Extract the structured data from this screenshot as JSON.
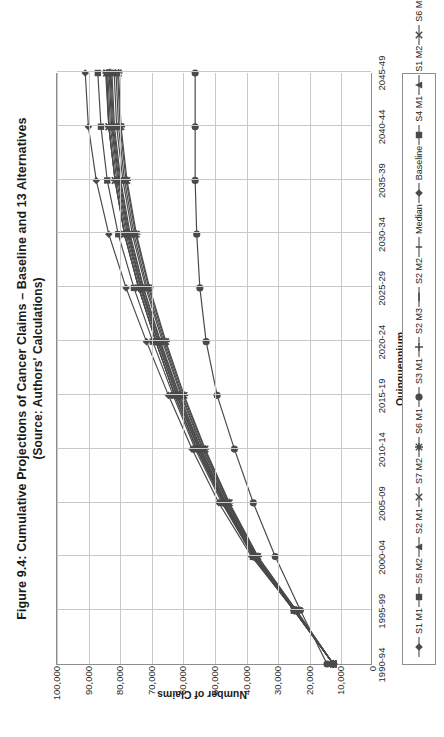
{
  "title": {
    "line1": "Figure 9.4:  Cumulative Projections of Cancer Claims – Baseline and 13 Alternatives",
    "line2": "(Source:  Authors' Calculations)"
  },
  "chart_data": {
    "type": "line",
    "title": "Figure 9.4:  Cumulative Projections of Cancer Claims – Baseline and 13 Alternatives (Source:  Authors' Calculations)",
    "xlabel": "Quinquennium",
    "ylabel": "Number of Claims",
    "grid": true,
    "legend_position": "bottom",
    "ylim": [
      0,
      100000
    ],
    "yticks": [
      0,
      10000,
      20000,
      30000,
      40000,
      50000,
      60000,
      70000,
      80000,
      90000,
      100000
    ],
    "ytick_labels": [
      "0",
      "10,000",
      "20,000",
      "30,000",
      "40,000",
      "50,000",
      "60,000",
      "70,000",
      "80,000",
      "90,000",
      "100,000"
    ],
    "categories": [
      "1990-94",
      "1995-99",
      "2000-04",
      "2005-09",
      "2010-14",
      "2015-19",
      "2020-24",
      "2025-29",
      "2030-34",
      "2035-39",
      "2040-44",
      "2045-49"
    ],
    "series": [
      {
        "name": "S1 M1",
        "marker": "diamond",
        "color": "#4a4a4a",
        "values": [
          12000,
          24500,
          38000,
          48500,
          57000,
          64500,
          71500,
          78000,
          83500,
          87500,
          90000,
          91000
        ]
      },
      {
        "name": "S5 M2",
        "marker": "square",
        "color": "#4a4a4a",
        "values": [
          12000,
          24500,
          37500,
          47500,
          56000,
          63000,
          69500,
          75500,
          80500,
          84000,
          86000,
          87000
        ]
      },
      {
        "name": "S2 M1",
        "marker": "triangle",
        "color": "#4a4a4a",
        "values": [
          12000,
          24500,
          37500,
          47000,
          55500,
          62500,
          68500,
          74000,
          78500,
          81500,
          83500,
          84500
        ]
      },
      {
        "name": "S7 M2",
        "marker": "cross-x",
        "color": "#4a4a4a",
        "values": [
          12000,
          24500,
          37500,
          47000,
          55500,
          62500,
          68500,
          74000,
          78500,
          81500,
          83500,
          84300
        ]
      },
      {
        "name": "S6 M1",
        "marker": "asterisk",
        "color": "#4a4a4a",
        "values": [
          12000,
          24500,
          37500,
          47000,
          55500,
          62500,
          68500,
          74000,
          78500,
          81500,
          83500,
          84100
        ]
      },
      {
        "name": "S3 M1",
        "marker": "circle",
        "color": "#4a4a4a",
        "values": [
          12000,
          24500,
          37500,
          47000,
          55000,
          62000,
          68000,
          73500,
          78000,
          81000,
          83000,
          83800
        ]
      },
      {
        "name": "S2 M3",
        "marker": "plus",
        "color": "#4a4a4a",
        "values": [
          12000,
          24300,
          37200,
          46700,
          54800,
          61800,
          67800,
          73200,
          77600,
          80600,
          82600,
          83400
        ]
      },
      {
        "name": "S2 M2",
        "marker": "dash",
        "color": "#4a4a4a",
        "values": [
          12000,
          24300,
          37000,
          46500,
          54500,
          61500,
          67500,
          73000,
          77300,
          80300,
          82300,
          83100
        ]
      },
      {
        "name": "Median",
        "marker": "line",
        "color": "#4a4a4a",
        "values": [
          12000,
          24200,
          36900,
          46300,
          54300,
          61200,
          67200,
          72600,
          77000,
          80000,
          82000,
          82800
        ]
      },
      {
        "name": "Baseline",
        "marker": "diamond",
        "color": "#4a4a4a",
        "values": [
          12000,
          24200,
          36800,
          46200,
          54100,
          61000,
          67000,
          72400,
          76700,
          79700,
          81700,
          82500
        ]
      },
      {
        "name": "S4 M1",
        "marker": "square",
        "color": "#4a4a4a",
        "values": [
          12000,
          24000,
          36600,
          45800,
          53700,
          60500,
          66400,
          71700,
          76000,
          79000,
          81000,
          81800
        ]
      },
      {
        "name": "S1 M2",
        "marker": "triangle",
        "color": "#4a4a4a",
        "values": [
          12000,
          24000,
          36400,
          45600,
          53400,
          60200,
          66000,
          71300,
          75500,
          78500,
          80400,
          81200
        ]
      },
      {
        "name": "S6 M2",
        "marker": "cross-x",
        "color": "#4a4a4a",
        "values": [
          12000,
          23800,
          36200,
          45300,
          53000,
          59800,
          65600,
          70800,
          75000,
          78000,
          79900,
          80700
        ]
      },
      {
        "name": "S7 M1",
        "marker": "asterisk",
        "color": "#4a4a4a",
        "values": [
          12000,
          23800,
          36000,
          45100,
          52800,
          59500,
          65300,
          70500,
          74700,
          77700,
          79600,
          80400
        ]
      },
      {
        "name": "S5 M1",
        "marker": "circle",
        "color": "#4a4a4a",
        "values": [
          14000,
          22500,
          30500,
          37500,
          43500,
          49000,
          52500,
          54500,
          55500,
          56000,
          56000,
          56000
        ]
      }
    ]
  },
  "legend": {
    "items": [
      {
        "label": "S1 M1",
        "marker": "diamond"
      },
      {
        "label": "S5 M2",
        "marker": "square"
      },
      {
        "label": "S2 M1",
        "marker": "triangle"
      },
      {
        "label": "S7 M2",
        "marker": "cross-x"
      },
      {
        "label": "S6 M1",
        "marker": "asterisk"
      },
      {
        "label": "S3 M1",
        "marker": "circle"
      },
      {
        "label": "S2 M3",
        "marker": "plus"
      },
      {
        "label": "S2 M2",
        "marker": "dash"
      },
      {
        "label": "Median",
        "marker": "line"
      },
      {
        "label": "Baseline",
        "marker": "diamond"
      },
      {
        "label": "S4 M1",
        "marker": "square"
      },
      {
        "label": "S1 M2",
        "marker": "triangle"
      },
      {
        "label": "S6 M2",
        "marker": "cross-x"
      },
      {
        "label": "S7 M1",
        "marker": "asterisk"
      },
      {
        "label": "S5 M1",
        "marker": "circle"
      }
    ]
  },
  "colors": {
    "series_line": "#4a4a4a",
    "frame": "#8d8d8d",
    "gridline": "#c9c9c9",
    "text": "#1b1b1b"
  }
}
